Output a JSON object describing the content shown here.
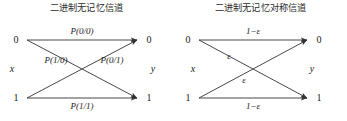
{
  "figure": {
    "type": "diagram",
    "stroke_color": "#333333",
    "text_color": "#1a1a1a",
    "background": "#ffffff"
  },
  "panels": [
    {
      "id": "bmc",
      "title": "二进制无记忆信道",
      "input_var": "x",
      "output_var": "y",
      "input_nodes": [
        "0",
        "1"
      ],
      "output_nodes": [
        "0",
        "1"
      ],
      "edges": [
        {
          "from": "0",
          "to": "0",
          "label": "P(0/0)"
        },
        {
          "from": "0",
          "to": "1",
          "label": "P(1/0)"
        },
        {
          "from": "1",
          "to": "0",
          "label": "P(0/1)"
        },
        {
          "from": "1",
          "to": "1",
          "label": "P(1/1)"
        }
      ]
    },
    {
      "id": "bsc",
      "title": "二进制无记忆对称信道",
      "input_var": "x",
      "output_var": "y",
      "input_nodes": [
        "0",
        "1"
      ],
      "output_nodes": [
        "0",
        "1"
      ],
      "edges": [
        {
          "from": "0",
          "to": "0",
          "label": "1−ε"
        },
        {
          "from": "0",
          "to": "1",
          "label": "ε"
        },
        {
          "from": "1",
          "to": "0",
          "label": "ε"
        },
        {
          "from": "1",
          "to": "1",
          "label": "1−ε"
        }
      ]
    }
  ]
}
